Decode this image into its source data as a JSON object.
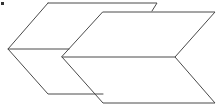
{
  "diagram": {
    "stroke_color": "#4a4a4a",
    "background": "#ffffff",
    "shapes": [
      {
        "name": "back-chevron",
        "top_path": "M48,3 L157,3 L152,11",
        "left_path": "M48,3 L8,49 L48,94 L103,94",
        "middle_path": "M8,49 L69,49"
      },
      {
        "name": "front-chevron",
        "outline_path": "M103,12 L215,12 L175,57 L215,103 L103,103 L62,57 Z",
        "middle_path": "M62,57 L175,57"
      }
    ],
    "corner_mark_color": "#333333"
  }
}
